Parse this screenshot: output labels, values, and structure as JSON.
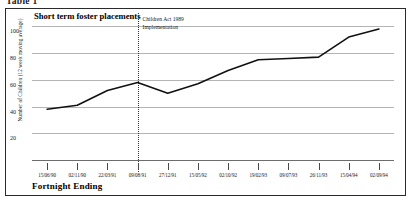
{
  "figure": {
    "caption": "Table 1"
  },
  "chart_data": {
    "type": "line",
    "title": "Short term foster placements",
    "xlabel": "Fortnight Ending",
    "ylabel": "Number of Children (12 week moving average)",
    "ylim": [
      0,
      110
    ],
    "yticks": [
      20,
      40,
      60,
      80,
      100
    ],
    "grid": true,
    "legend": false,
    "line_color": "#111111",
    "categories": [
      "15/06/90",
      "02/11/90",
      "22/03/91",
      "09/08/91",
      "27/12/91",
      "15/05/92",
      "02/10/92",
      "19/02/93",
      "09/07/93",
      "26/11/93",
      "15/04/94",
      "02/09/94"
    ],
    "values": [
      38,
      41,
      52,
      58,
      50,
      57,
      67,
      75,
      76,
      77,
      92,
      98
    ],
    "annotations": [
      {
        "text_line_1": "Children Act 1989",
        "text_line_2": "Implementation",
        "at_category": "09/08/91",
        "style": "dotted-vertical-line"
      }
    ]
  }
}
